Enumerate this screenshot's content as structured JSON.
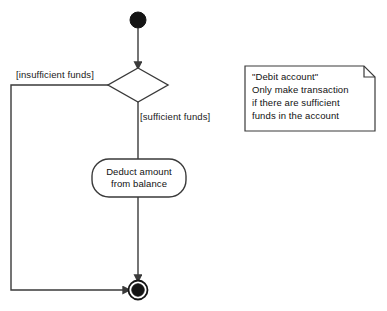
{
  "diagram": {
    "type": "uml-activity-diagram",
    "colors": {
      "stroke": "#3a3a3a",
      "fill": "#ffffff",
      "node_fill": "#111111",
      "text": "#111111",
      "background": "#ffffff"
    },
    "start_node": {
      "name": "initial-node",
      "cx": 138,
      "cy": 20,
      "r": 8
    },
    "decision": {
      "name": "decision-diamond",
      "cx": 138,
      "cy": 85,
      "half_width": 30,
      "half_height": 17
    },
    "activity": {
      "label_line_1": "Deduct amount",
      "label_line_2": "from balance",
      "x": 92,
      "y": 159,
      "width": 94,
      "height": 38,
      "radius": 17
    },
    "end_node": {
      "name": "final-node",
      "cx": 138,
      "cy": 290,
      "outer_r": 10,
      "inner_r": 6.5
    },
    "edges": [
      {
        "name": "start-to-decision",
        "label": ""
      },
      {
        "name": "decision-to-activity",
        "label": "[sufficient funds]"
      },
      {
        "name": "activity-to-end",
        "label": ""
      },
      {
        "name": "decision-to-end-loop",
        "label": "[insufficient funds]"
      }
    ],
    "labels": {
      "insufficient": "[insufficient funds]",
      "sufficient": "[sufficient funds]"
    },
    "note": {
      "name": "uml-note",
      "x": 245,
      "y": 66,
      "width": 130,
      "height": 65,
      "fold": 11,
      "lines": [
        "\"Debit account\"",
        "Only make transaction",
        "if there are sufficient",
        "funds in the account"
      ]
    }
  }
}
